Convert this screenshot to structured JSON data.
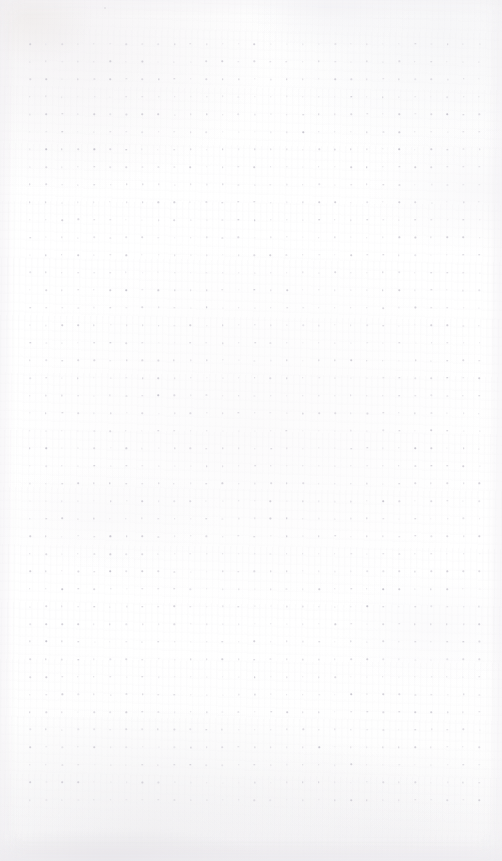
{
  "page": {
    "kind": "scanned-dot-grid-notebook-page",
    "width": 502,
    "height": 861,
    "content_text": "",
    "has_handwriting": false,
    "has_printed_text": false,
    "paper_color": "#ffffff",
    "paper_tone_note": "off-white scan with faint warm and cool mottling"
  },
  "grid": {
    "name": "dot-grid",
    "columns": 29,
    "rows": 44,
    "spacing_x": 16.05,
    "spacing_y": 17.58,
    "origin_x": 30,
    "origin_y": 44,
    "dot_diameter": 1.4,
    "dot_color": "#d4d2d9",
    "dot_color_soft": "#dedce2",
    "dot_color_faint": "#e6e5ea",
    "dot_color_dark": "#c9c7d0",
    "margin_left": 30,
    "margin_right": 22,
    "margin_top": 44,
    "margin_bottom": 61
  },
  "artifacts": {
    "speck": {
      "name": "stray-speck",
      "x": 105,
      "y": 8,
      "color": "#e2e0e5"
    },
    "bottom_shadow": {
      "name": "scan-shadow-bottom",
      "height": 62,
      "color": "#e2e1e5"
    },
    "texture_note": "flatbed scan grain and blotches"
  }
}
